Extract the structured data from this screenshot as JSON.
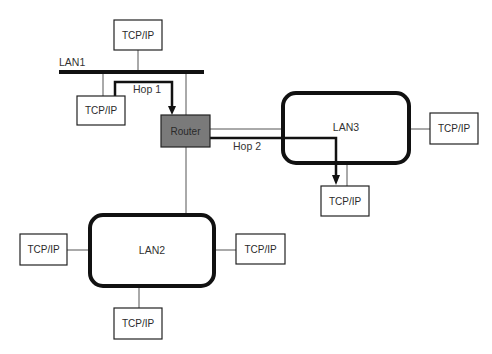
{
  "diagram": {
    "type": "network-topology",
    "lans": [
      {
        "id": "lan1",
        "label": "LAN1",
        "shape": "bus"
      },
      {
        "id": "lan2",
        "label": "LAN2",
        "shape": "rounded-rect"
      },
      {
        "id": "lan3",
        "label": "LAN3",
        "shape": "rounded-rect"
      }
    ],
    "router": {
      "label": "Router",
      "fill": "#7a7a7a"
    },
    "hosts": [
      {
        "id": "host-lan1-top",
        "label": "TCP/IP",
        "network": "LAN1"
      },
      {
        "id": "host-lan1-left",
        "label": "TCP/IP",
        "network": "LAN1"
      },
      {
        "id": "host-lan3-right",
        "label": "TCP/IP",
        "network": "LAN3"
      },
      {
        "id": "host-lan3-bottom",
        "label": "TCP/IP",
        "network": "LAN3"
      },
      {
        "id": "host-lan2-left",
        "label": "TCP/IP",
        "network": "LAN2"
      },
      {
        "id": "host-lan2-right",
        "label": "TCP/IP",
        "network": "LAN2"
      },
      {
        "id": "host-lan2-bottom",
        "label": "TCP/IP",
        "network": "LAN2"
      }
    ],
    "hops": [
      {
        "label": "Hop 1",
        "from": "host-lan1-left",
        "to": "Router"
      },
      {
        "label": "Hop 2",
        "from": "Router",
        "to": "host-lan3-bottom"
      }
    ],
    "colors": {
      "line": "#1a1a1a",
      "thin_line": "#555555",
      "router_fill": "#7a7a7a",
      "box_fill": "#ffffff"
    }
  }
}
